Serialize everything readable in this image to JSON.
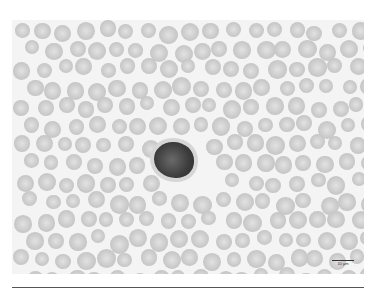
{
  "image": {
    "description": "Blood smear micrograph showing crenated red blood cells (echinocytes) surrounding a single dark-staining nucleated cell",
    "scale_bar": {
      "label": "10 µm"
    }
  }
}
